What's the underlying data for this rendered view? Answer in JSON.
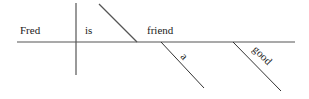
{
  "diagram": {
    "type": "sentence-diagram",
    "sentence": "Fred is a good friend",
    "subject": "Fred",
    "verb": "is",
    "predicate_nominative": "friend",
    "modifiers": [
      "a",
      "good"
    ],
    "line_color": "#555555",
    "text_color": "#1a1a1a"
  }
}
